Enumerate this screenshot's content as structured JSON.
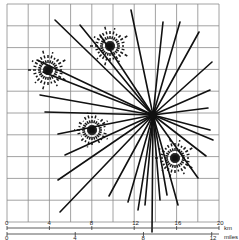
{
  "figure": {
    "grid": {
      "x0": 7,
      "y0": 4,
      "x1": 219,
      "y1": 222,
      "cols": 10,
      "rows": 10,
      "color": "#888888"
    },
    "main_hub": {
      "x": 153,
      "y": 115
    },
    "main_spokes": [
      [
        131,
        10
      ],
      [
        163,
        22
      ],
      [
        180,
        22
      ],
      [
        199,
        32
      ],
      [
        212,
        62
      ],
      [
        210,
        90
      ],
      [
        208,
        108
      ],
      [
        210,
        130
      ],
      [
        213,
        140
      ],
      [
        206,
        156
      ],
      [
        198,
        178
      ],
      [
        178,
        205
      ],
      [
        167,
        195
      ],
      [
        160,
        200
      ],
      [
        152,
        232
      ],
      [
        145,
        205
      ],
      [
        138,
        210
      ],
      [
        128,
        202
      ],
      [
        109,
        196
      ],
      [
        60,
        212
      ],
      [
        58,
        180
      ],
      [
        65,
        155
      ],
      [
        58,
        134
      ],
      [
        45,
        112
      ],
      [
        40,
        95
      ],
      [
        43,
        72
      ],
      [
        37,
        60
      ],
      [
        55,
        20
      ],
      [
        80,
        25
      ],
      [
        100,
        35
      ]
    ],
    "dashed_clusters": [
      {
        "x": 48,
        "y": 70,
        "r": 20
      },
      {
        "x": 110,
        "y": 46,
        "r": 20
      },
      {
        "x": 92,
        "y": 130,
        "r": 18
      },
      {
        "x": 175,
        "y": 158,
        "r": 20
      }
    ],
    "scale_km": {
      "label": "km",
      "ticks": [
        "0",
        "4",
        "8",
        "12",
        "16",
        "20"
      ]
    },
    "scale_miles": {
      "label": "miles",
      "ticks": [
        "0",
        "4",
        "8",
        "12"
      ]
    }
  }
}
